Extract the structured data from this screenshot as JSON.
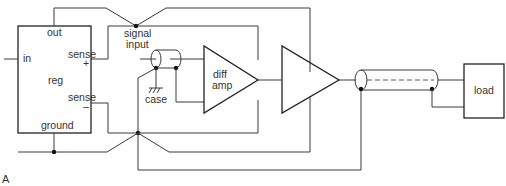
{
  "figure": {
    "label": "A",
    "colors": {
      "line": "#3a3a3a",
      "node": "#111111",
      "text": "#333333",
      "background": "#ffffff"
    }
  },
  "regulator": {
    "name": "reg",
    "pins": {
      "out": "out",
      "in": "in",
      "sense_plus": "sense",
      "sense_plus_sign": "+",
      "sense_minus": "sense",
      "sense_minus_sign": "–",
      "ground": "ground"
    }
  },
  "signal_input": {
    "line1": "signal",
    "line2": "input"
  },
  "case_ground": {
    "label": "case",
    "icon": "chassis-ground-icon"
  },
  "diff_amp": {
    "line1": "diff",
    "line2": "amp"
  },
  "load": {
    "label": "load"
  }
}
